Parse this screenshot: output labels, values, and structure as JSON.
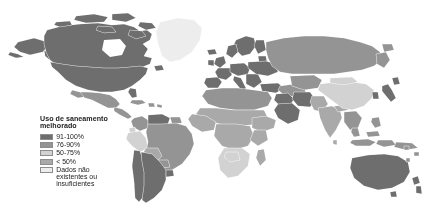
{
  "figure": {
    "kind": "world-choropleth-map",
    "background_color": "#ffffff",
    "projection": "equirectangular-world"
  },
  "legend": {
    "title": "Uso de saneamento\nmelhorado",
    "title_line1": "Uso de saneamento",
    "title_line2": "melhorado",
    "entries": [
      {
        "label": "91-100%",
        "color": "#6e6e6e"
      },
      {
        "label": "76-90%",
        "color": "#949494"
      },
      {
        "label": "50-75%",
        "color": "#d2d2d2"
      },
      {
        "label": "< 50%",
        "color": "#a9a9a9"
      },
      {
        "label": "Dados não\nexistentes ou\ninsuficientes",
        "color": "#ededed"
      }
    ]
  },
  "chart_data": {
    "type": "heatmap",
    "title": "Uso de saneamento melhorado",
    "xlabel": "",
    "ylabel": "",
    "legend_position": "lower-left-inset",
    "grid": false,
    "categories": [
      "91-100%",
      "76-90%",
      "50-75%",
      "< 50%",
      "Dados não existentes ou insuficientes"
    ],
    "category_colors": [
      "#6e6e6e",
      "#949494",
      "#d2d2d2",
      "#a9a9a9",
      "#ededed"
    ],
    "regions": [
      {
        "name": "Canada",
        "category": "91-100%"
      },
      {
        "name": "United States",
        "category": "91-100%"
      },
      {
        "name": "Greenland",
        "category": "Dados não existentes ou insuficientes"
      },
      {
        "name": "Mexico",
        "category": "76-90%"
      },
      {
        "name": "Central America",
        "category": "76-90%"
      },
      {
        "name": "Caribbean",
        "category": "76-90%"
      },
      {
        "name": "Colombia",
        "category": "76-90%"
      },
      {
        "name": "Venezuela",
        "category": "91-100%"
      },
      {
        "name": "Brazil",
        "category": "76-90%"
      },
      {
        "name": "Peru",
        "category": "50-75%"
      },
      {
        "name": "Bolivia",
        "category": "< 50%"
      },
      {
        "name": "Chile",
        "category": "91-100%"
      },
      {
        "name": "Argentina",
        "category": "91-100%"
      },
      {
        "name": "Western Europe",
        "category": "91-100%"
      },
      {
        "name": "Eastern Europe",
        "category": "91-100%"
      },
      {
        "name": "Russia",
        "category": "76-90%"
      },
      {
        "name": "North Africa",
        "category": "76-90%"
      },
      {
        "name": "Sahel",
        "category": "< 50%"
      },
      {
        "name": "West Africa",
        "category": "< 50%"
      },
      {
        "name": "Central Africa",
        "category": "< 50%"
      },
      {
        "name": "East Africa",
        "category": "< 50%"
      },
      {
        "name": "Southern Africa",
        "category": "50-75%"
      },
      {
        "name": "Middle East",
        "category": "91-100%"
      },
      {
        "name": "Saudi Arabia",
        "category": "91-100%"
      },
      {
        "name": "India",
        "category": "< 50%"
      },
      {
        "name": "China",
        "category": "50-75%"
      },
      {
        "name": "Southeast Asia",
        "category": "76-90%"
      },
      {
        "name": "Indonesia",
        "category": "76-90%"
      },
      {
        "name": "Japan",
        "category": "91-100%"
      },
      {
        "name": "Australia",
        "category": "91-100%"
      },
      {
        "name": "New Zealand",
        "category": "91-100%"
      }
    ]
  }
}
